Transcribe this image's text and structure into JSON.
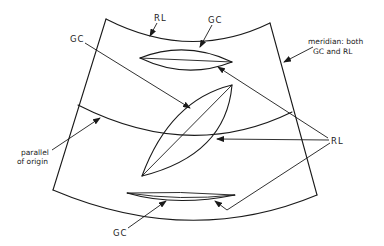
{
  "diagram": {
    "labels": {
      "rl_top": "RL",
      "gc_top": "GC",
      "gc_left": "GC",
      "meridian_line1": "meridian: both",
      "meridian_line2": "GC and RL",
      "parallel_line1": "parallel",
      "parallel_line2": "of origin",
      "rl_right": "RL",
      "gc_bottom": "GC"
    },
    "colors": {
      "stroke": "#1a1a1a",
      "background": "#ffffff"
    }
  }
}
